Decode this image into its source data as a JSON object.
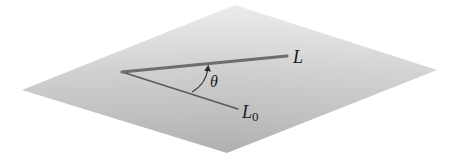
{
  "diagram": {
    "plane": {
      "fill_top": "#e9e9e9",
      "fill_bottom": "#b3b3b3",
      "corners": {
        "top": [
          235,
          5
        ],
        "right": [
          437,
          70
        ],
        "bottom": [
          227,
          153
        ],
        "left": [
          22,
          90
        ]
      }
    },
    "vertex": [
      122,
      72
    ],
    "line_L": {
      "label": "L",
      "end": [
        287,
        56
      ],
      "color": "#6e6e6e",
      "width": 3.2
    },
    "line_L0": {
      "label_main": "L",
      "label_subscript": "0",
      "end": [
        238,
        109
      ],
      "color": "#5a5a5a",
      "width": 1.6
    },
    "angle": {
      "label": "θ",
      "arc_color": "#3a3a3a"
    }
  }
}
